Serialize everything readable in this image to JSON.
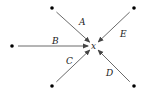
{
  "diagram": {
    "center": {
      "label": "x",
      "pos": [
        94,
        46
      ]
    },
    "nodes": [
      {
        "id": "A",
        "label": "A",
        "pos": [
          52,
          8
        ],
        "label_pos": [
          79,
          25
        ]
      },
      {
        "id": "E",
        "label": "E",
        "pos": [
          134,
          8
        ],
        "label_pos": [
          120,
          37
        ]
      },
      {
        "id": "B",
        "label": "B",
        "pos": [
          12,
          46
        ],
        "label_pos": [
          52,
          44
        ]
      },
      {
        "id": "C",
        "label": "C",
        "pos": [
          52,
          86
        ],
        "label_pos": [
          66,
          64
        ]
      },
      {
        "id": "D",
        "label": "D",
        "pos": [
          134,
          86
        ],
        "label_pos": [
          106,
          76
        ]
      }
    ],
    "colors": {
      "line": "#444444",
      "dot": "#000000"
    }
  }
}
